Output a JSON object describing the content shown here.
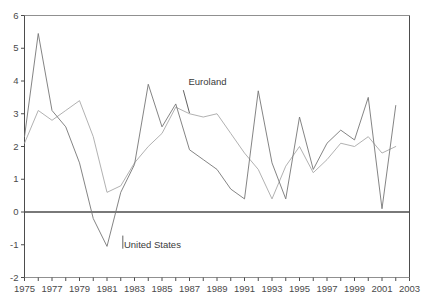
{
  "chart_data": {
    "type": "line",
    "title": "",
    "subtitle": "",
    "xlabel": "",
    "ylabel": "",
    "xlim": [
      1975,
      2003
    ],
    "ylim": [
      -2,
      6
    ],
    "grid": false,
    "legend_position": "inline-annotations",
    "zero_line": 0,
    "x_tick_labels": [
      "1975",
      "1977",
      "1979",
      "1981",
      "1983",
      "1985",
      "1987",
      "1989",
      "1991",
      "1993",
      "1995",
      "1997",
      "1999",
      "2001",
      "2003"
    ],
    "x_tick_values": [
      1975,
      1977,
      1979,
      1981,
      1983,
      1985,
      1987,
      1989,
      1991,
      1993,
      1995,
      1997,
      1999,
      2001,
      2003
    ],
    "x_minor_ticks": [
      1976,
      1978,
      1980,
      1982,
      1984,
      1986,
      1988,
      1990,
      1992,
      1994,
      1996,
      1998,
      2000,
      2002
    ],
    "y_tick_labels": [
      "6",
      "5",
      "4",
      "3",
      "2",
      "1",
      "0",
      "-1",
      "-2"
    ],
    "y_tick_values": [
      6,
      5,
      4,
      3,
      2,
      1,
      0,
      -1,
      -2
    ],
    "x": [
      1975,
      1976,
      1977,
      1978,
      1979,
      1980,
      1981,
      1982,
      1983,
      1984,
      1985,
      1986,
      1987,
      1988,
      1989,
      1990,
      1991,
      1992,
      1993,
      1994,
      1995,
      1996,
      1997,
      1998,
      1999,
      2000,
      2001,
      2002
    ],
    "series": [
      {
        "name": "Euroland",
        "color": "#a8a8a8",
        "label_text": "Euroland",
        "values": [
          2.1,
          3.1,
          2.8,
          3.1,
          3.4,
          2.3,
          0.6,
          0.8,
          1.5,
          2.0,
          2.4,
          3.2,
          3.0,
          2.9,
          3.0,
          2.4,
          1.8,
          1.3,
          0.4,
          1.4,
          2.0,
          1.2,
          1.6,
          2.1,
          2.0,
          2.3,
          1.8,
          2.0
        ]
      },
      {
        "name": "United States",
        "color": "#767676",
        "label_text": "United States",
        "values": [
          2.3,
          5.45,
          3.1,
          2.6,
          1.5,
          -0.2,
          -1.05,
          0.6,
          1.45,
          3.9,
          2.6,
          3.3,
          1.9,
          1.6,
          1.3,
          0.7,
          0.4,
          3.7,
          1.5,
          0.4,
          2.9,
          1.3,
          2.1,
          2.5,
          2.2,
          3.5,
          0.1,
          3.25
        ]
      }
    ],
    "annotations": [
      {
        "name": "euroland-annotation",
        "text": "Euroland",
        "x_year": 1987.0,
        "y_value": 3.95
      },
      {
        "name": "united-states-annotation",
        "text": "United States",
        "x_year": 1982.3,
        "y_value": -1.05
      }
    ]
  },
  "colors": {
    "frame": "#4d4d4d",
    "zero_line": "#4d4d4d",
    "euroland": "#a8a8a8",
    "united_states": "#767676",
    "tick_text": "#4a4a4a",
    "label_text": "#3a3a3a",
    "background": "#ffffff"
  }
}
